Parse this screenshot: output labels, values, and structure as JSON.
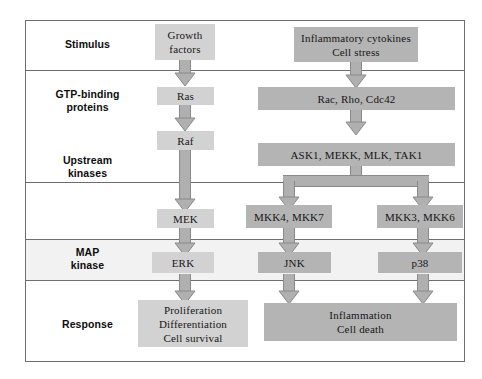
{
  "diagram": {
    "rows": [
      {
        "id": "stimulus",
        "label": "Stimulus"
      },
      {
        "id": "gtp",
        "label": "GTP-binding\nproteins"
      },
      {
        "id": "upstream",
        "label": "Upstream\nkinases"
      },
      {
        "id": "mapk",
        "label": "MAP\nkinase"
      },
      {
        "id": "response",
        "label": "Response"
      }
    ],
    "nodes": [
      {
        "id": "growth-factors",
        "lines": [
          "Growth",
          "factors"
        ]
      },
      {
        "id": "cytokines",
        "lines": [
          "Inflammatory cytokines",
          "Cell stress"
        ]
      },
      {
        "id": "ras",
        "lines": [
          "Ras"
        ]
      },
      {
        "id": "rac-rho-cdc42",
        "lines": [
          "Rac, Rho, Cdc42"
        ]
      },
      {
        "id": "raf",
        "lines": [
          "Raf"
        ]
      },
      {
        "id": "ask1-mekk",
        "lines": [
          "ASK1, MEKK, MLK, TAK1"
        ]
      },
      {
        "id": "mek",
        "lines": [
          "MEK"
        ]
      },
      {
        "id": "mkk4-mkk7",
        "lines": [
          "MKK4, MKK7"
        ]
      },
      {
        "id": "mkk3-mkk6",
        "lines": [
          "MKK3, MKK6"
        ]
      },
      {
        "id": "erk",
        "lines": [
          "ERK"
        ]
      },
      {
        "id": "jnk",
        "lines": [
          "JNK"
        ]
      },
      {
        "id": "p38",
        "lines": [
          "p38"
        ]
      },
      {
        "id": "response-left",
        "lines": [
          "Proliferation",
          "Differentiation",
          "Cell survival"
        ]
      },
      {
        "id": "response-right",
        "lines": [
          "Inflammation",
          "Cell death"
        ]
      }
    ],
    "colors": {
      "box_light": "#d2d2d2",
      "box_mid": "#b4b4b4",
      "arrow_fill": "#b0b0b0",
      "arrow_stroke": "#8a8a8a",
      "frame": "#6e6e6e",
      "band_tint": "#f2f2f2",
      "text": "#161616"
    }
  }
}
